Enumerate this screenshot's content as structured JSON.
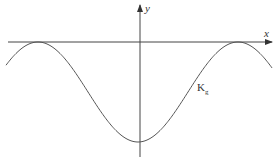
{
  "diagram": {
    "axes": {
      "x_label": "x",
      "y_label": "y"
    },
    "curve": {
      "label_main": "K",
      "label_sub": "g",
      "type": "cosine",
      "description": "wave touching x-axis at two maxima with minimum on y-axis"
    },
    "colors": {
      "line": "#555555",
      "background": "#ffffff"
    }
  }
}
